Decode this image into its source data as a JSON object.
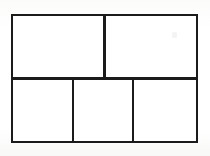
{
  "document": {
    "title": "Partitioned Rectangle",
    "background_color": "#fdfdfc",
    "ink_color": "#1b1b1b",
    "fill_color": "#ffffff",
    "stroke_width_px": 2.5
  },
  "figure": {
    "name": "partitioned-rectangle",
    "outer_rectangle": {
      "label": "",
      "x": 11,
      "y": 14,
      "width": 187,
      "height": 129
    },
    "rows": [
      {
        "name": "top-row",
        "label": "",
        "height": 64,
        "cells": [
          {
            "name": "top-left",
            "label": "",
            "width": 92
          },
          {
            "name": "top-right",
            "label": "",
            "width": 92
          }
        ]
      },
      {
        "name": "bottom-row",
        "label": "",
        "height": 65,
        "cells": [
          {
            "name": "bottom-left",
            "label": "",
            "width": 60
          },
          {
            "name": "bottom-middle",
            "label": "",
            "width": 58
          },
          {
            "name": "bottom-right",
            "label": "",
            "width": 64
          }
        ]
      }
    ],
    "dividers": [
      {
        "name": "row-split",
        "orientation": "horizontal",
        "position": 77
      },
      {
        "name": "top-column",
        "orientation": "vertical",
        "position": 103
      },
      {
        "name": "bottom-column-1",
        "orientation": "vertical",
        "position": 71
      },
      {
        "name": "bottom-column-2",
        "orientation": "vertical",
        "position": 131
      }
    ]
  }
}
